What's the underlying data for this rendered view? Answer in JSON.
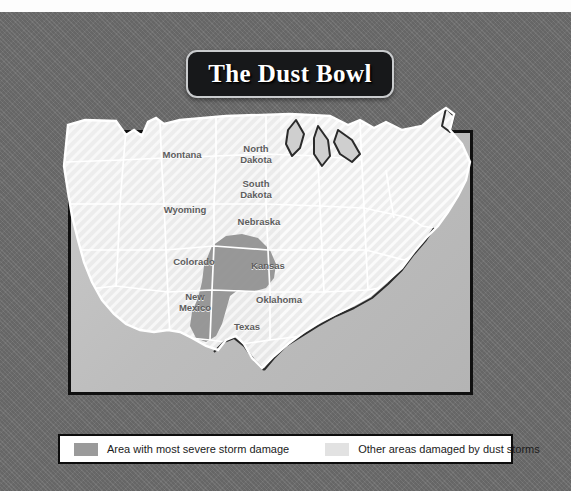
{
  "title": {
    "text": "The Dust Bowl"
  },
  "map": {
    "name": "united-states-dust-bowl-map",
    "state_labels": [
      {
        "name": "montana",
        "text": "Montana",
        "x": 152,
        "y": 56
      },
      {
        "name": "north-dakota",
        "text": "North\nDakota",
        "x": 226,
        "y": 50
      },
      {
        "name": "south-dakota",
        "text": "South\nDakota",
        "x": 226,
        "y": 85
      },
      {
        "name": "wyoming",
        "text": "Wyoming",
        "x": 154,
        "y": 110
      },
      {
        "name": "nebraska",
        "text": "Nebraska",
        "x": 228,
        "y": 122
      },
      {
        "name": "colorado",
        "text": "Colorado",
        "x": 163,
        "y": 162
      },
      {
        "name": "kansas",
        "text": "Kansas",
        "x": 237,
        "y": 166
      },
      {
        "name": "oklahoma",
        "text": "Oklahoma",
        "x": 248,
        "y": 200
      },
      {
        "name": "new-mexico",
        "text": "New\nMexico",
        "x": 165,
        "y": 203
      },
      {
        "name": "texas",
        "text": "Texas",
        "x": 217,
        "y": 227
      }
    ],
    "colors": {
      "severe_damage": "#8f8f8f",
      "other_damage": "#dcdcdc",
      "state_border": "#ffffff",
      "coastline": "#2a2a2a",
      "frame_border": "#101010",
      "backdrop": "#6e6e6e"
    }
  },
  "legend": {
    "items": [
      {
        "name": "severe-damage",
        "label": "Area with most severe storm damage",
        "color": "#9a9a9a"
      },
      {
        "name": "other-damage",
        "label": "Other areas damaged by dust storms",
        "color": "#e2e2e2"
      }
    ]
  }
}
